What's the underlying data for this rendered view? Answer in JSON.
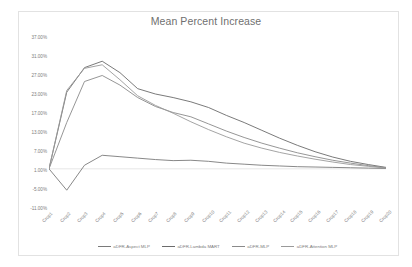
{
  "chart_data": {
    "type": "line",
    "title": "Mean Percent Increase",
    "xlabel": "",
    "ylabel": "",
    "grid": false,
    "zero_line": true,
    "legend_position": "bottom",
    "ylim": [
      -11,
      37
    ],
    "ytick_step": 6,
    "ytick_labels": [
      "37.00%",
      "31.00%",
      "27.00%",
      "23.00%",
      "17.00%",
      "13.00%",
      "7.00%",
      "1.00%",
      "-5.00%",
      "-11.00%"
    ],
    "ytick_values": [
      37,
      31,
      25,
      19,
      13,
      7,
      1,
      -5,
      -11
    ],
    "categories": [
      "Crop1",
      "Crop2",
      "Crop3",
      "Crop4",
      "Crop5",
      "Crop6",
      "Crop7",
      "Crop8",
      "Crop9",
      "Crop10",
      "Crop11",
      "Crop12",
      "Crop13",
      "Crop14",
      "Crop15",
      "Crop16",
      "Crop17",
      "Crop18",
      "Crop19",
      "Crop20"
    ],
    "series": [
      {
        "name": "aDFR-Aspect MLP",
        "color": "#7a7a7a",
        "values": [
          0.0,
          -6.0,
          1.0,
          3.8,
          3.4,
          3.0,
          2.6,
          2.3,
          2.4,
          2.1,
          1.6,
          1.3,
          1.0,
          0.8,
          0.6,
          0.5,
          0.4,
          0.3,
          0.2,
          0.1
        ]
      },
      {
        "name": "aDFR-Lambda MART",
        "color": "#6b6b6b",
        "values": [
          0.0,
          21.5,
          28.4,
          30.2,
          27.0,
          22.5,
          21.0,
          20.0,
          18.8,
          17.2,
          15.0,
          13.0,
          10.8,
          8.6,
          6.6,
          4.8,
          3.3,
          2.1,
          1.2,
          0.4
        ]
      },
      {
        "name": "aDFR-MLP",
        "color": "#8a8a8a",
        "values": [
          0.0,
          13.0,
          24.5,
          26.2,
          23.5,
          20.0,
          17.5,
          15.8,
          14.6,
          12.6,
          10.6,
          8.8,
          7.2,
          5.8,
          4.5,
          3.4,
          2.4,
          1.6,
          0.9,
          0.3
        ]
      },
      {
        "name": "aDFR-Attention MLP",
        "color": "#9a9a9a",
        "values": [
          0.0,
          22.0,
          28.2,
          29.2,
          25.0,
          20.5,
          17.8,
          15.6,
          13.2,
          11.0,
          9.0,
          7.2,
          5.8,
          4.6,
          3.6,
          2.7,
          1.9,
          1.2,
          0.7,
          0.2
        ]
      }
    ]
  }
}
